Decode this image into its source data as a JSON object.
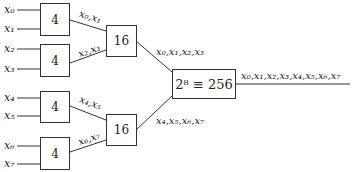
{
  "inputs": [
    "x0",
    "x1",
    "x2",
    "x3",
    "x4",
    "x5",
    "x6",
    "x7"
  ],
  "inputs_display": [
    "x₀",
    "x₁",
    "x₂",
    "x₃",
    "x₄",
    "x₅",
    "x₆",
    "x₇"
  ],
  "level1": [
    {
      "label": "4",
      "output": "x₀,x₁"
    },
    {
      "label": "4",
      "output": "x₂,x₃"
    },
    {
      "label": "4",
      "output": "x₄,x₅"
    },
    {
      "label": "4",
      "output": "x₆,x₇"
    }
  ],
  "level2": [
    {
      "label": "16",
      "output": "x₀,x₁,x₂,x₃"
    },
    {
      "label": "16",
      "output": "x₄,x₅,x₆,x₇"
    }
  ],
  "level3": {
    "label": "2⁸ ≡ 256",
    "output": "x₀,x₁,x₂,x₃,x₄,x₅,x₆,x₇"
  },
  "colors": {
    "stroke": "#333333",
    "text": "#222222",
    "background": "#ffffff"
  }
}
